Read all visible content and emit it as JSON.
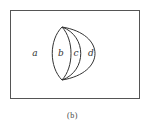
{
  "diagram": {
    "type": "venn-like region diagram",
    "frame": {
      "x": 10,
      "y": 10,
      "width": 129,
      "height": 88,
      "stroke": "#555555"
    },
    "vertices": {
      "top": [
        62,
        27
      ],
      "bottom": [
        62,
        80
      ]
    },
    "regions": [
      {
        "id": "a",
        "label": "a",
        "x": 35,
        "y": 56
      },
      {
        "id": "b",
        "label": "b",
        "x": 61,
        "y": 56
      },
      {
        "id": "c",
        "label": "c",
        "x": 76,
        "y": 56
      },
      {
        "id": "d",
        "label": "d",
        "x": 91,
        "y": 56
      }
    ],
    "curve_color": "#333333"
  },
  "caption": "(b)"
}
